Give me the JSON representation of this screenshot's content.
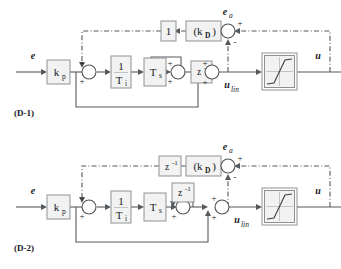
{
  "figure": {
    "type": "control-block-diagram",
    "background": "#ffffff",
    "line_color": "#555a5e",
    "block_fill": "#f2f2f2",
    "block_stroke": "#8d9196"
  },
  "diagrams": [
    {
      "caption": "(D-1)",
      "input_label": "e",
      "output_label": "u",
      "blocks": {
        "gain_p": "k",
        "gain_p_sub": "p",
        "integ_num": "1",
        "integ_den": "T",
        "integ_den_sub": "i",
        "sample": "T",
        "sample_sub": "s",
        "delay": "z",
        "delay_sup": "-1",
        "aw_top": "1",
        "gain_d_open": "(k",
        "gain_d_sub": "D",
        "gain_d_close": ")",
        "saturation": "saturation-nonlinearity"
      },
      "signals": {
        "error_aw": "e",
        "error_aw_sub": "a",
        "u_linear": "u",
        "u_linear_sub": "lin"
      },
      "signs": {
        "sum1_top": "+",
        "sum1_bottom": "+",
        "sum2_top": "+",
        "sum2_bottom": "+",
        "sum3_top": "+",
        "sum3_bottom": "+",
        "sum_aw_right": "+",
        "sum_aw_bottom": "-"
      }
    },
    {
      "caption": "(D-2)",
      "input_label": "e",
      "output_label": "u",
      "blocks": {
        "gain_p": "k",
        "gain_p_sub": "p",
        "integ_num": "1",
        "integ_den": "T",
        "integ_den_sub": "i",
        "sample": "T",
        "sample_sub": "s",
        "delay": "z",
        "delay_sup": "-1",
        "aw_top": "z",
        "aw_top_sup": "-1",
        "gain_d_open": "(k",
        "gain_d_sub": "D",
        "gain_d_close": ")",
        "saturation": "saturation-nonlinearity"
      },
      "signals": {
        "error_aw": "e",
        "error_aw_sub": "a",
        "u_linear": "u",
        "u_linear_sub": "lin"
      },
      "signs": {
        "sum1_top": "+",
        "sum1_bottom": "+",
        "sum2_top": "+",
        "sum2_bottom": "+",
        "sum3_top": "+",
        "sum3_bottom": "+",
        "sum_aw_right": "+",
        "sum_aw_bottom": "-"
      }
    }
  ]
}
